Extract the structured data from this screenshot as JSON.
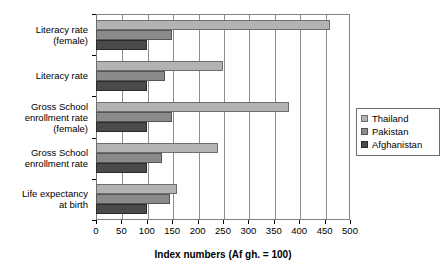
{
  "chart_data": {
    "type": "bar",
    "orientation": "horizontal",
    "title": "",
    "xlabel": "Index numbers (Af gh. = 100)",
    "ylabel": "",
    "xlim": [
      0,
      500
    ],
    "xticks": [
      0,
      50,
      100,
      150,
      200,
      250,
      300,
      350,
      400,
      450,
      500
    ],
    "grid": true,
    "legend_position": "right",
    "categories": [
      "Literacy rate (female)",
      "Literacy rate",
      "Gross School enrollment rate (female)",
      "Gross School enrollment rate",
      "Life expectancy at birth"
    ],
    "category_lines": [
      [
        "Literacy rate",
        "(female)"
      ],
      [
        "Literacy rate"
      ],
      [
        "Gross School",
        "enrollment rate",
        "(female)"
      ],
      [
        "Gross School",
        "enrollment rate"
      ],
      [
        "Life expectancy",
        "at birth"
      ]
    ],
    "series": [
      {
        "name": "Thailand",
        "color": "#b3b3b3",
        "values": [
          460,
          250,
          380,
          240,
          160
        ]
      },
      {
        "name": "Pakistan",
        "color": "#8a8a8a",
        "values": [
          150,
          135,
          150,
          130,
          145
        ]
      },
      {
        "name": "Afghanistan",
        "color": "#4a4a4a",
        "values": [
          100,
          100,
          100,
          100,
          100
        ]
      }
    ]
  },
  "legend": {
    "items": [
      {
        "label": "Thailand"
      },
      {
        "label": "Pakistan"
      },
      {
        "label": "Afghanistan"
      }
    ]
  },
  "axis": {
    "x_title": "Index numbers (Af gh. = 100)",
    "tick_labels": [
      "0",
      "50",
      "100",
      "150",
      "200",
      "250",
      "300",
      "350",
      "400",
      "450",
      "500"
    ]
  }
}
